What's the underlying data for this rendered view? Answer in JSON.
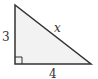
{
  "diagram": {
    "type": "right-triangle",
    "fill_color": "#f2f2f2",
    "stroke_color": "#333333",
    "vertices": {
      "top": [
        15,
        5
      ],
      "right_angle": [
        15,
        64
      ],
      "right": [
        91,
        64
      ]
    },
    "labels": {
      "vertical_leg": "3",
      "hypotenuse": "x",
      "horizontal_leg": "4"
    },
    "right_angle_marker": true
  }
}
